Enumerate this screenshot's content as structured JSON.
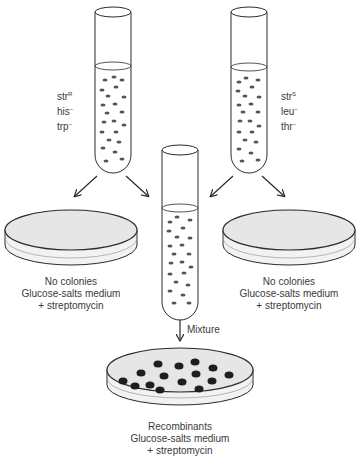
{
  "diagram": {
    "type": "bacterial-conjugation-recombination-experiment",
    "colors": {
      "line": "#2a2a2a",
      "medium": "#e6e6e6",
      "cell": "#555555",
      "colony": "#1e1e1e"
    },
    "tubes": [
      {
        "id": "left-tube",
        "strain": {
          "str": "str",
          "str_sup": "R",
          "m1": "his",
          "m1_sup": "−",
          "m2": "trp",
          "m2_sup": "−"
        }
      },
      {
        "id": "right-tube",
        "strain": {
          "str": "str",
          "str_sup": "S",
          "m1": "leu",
          "m1_sup": "−",
          "m2": "thr",
          "m2_sup": "−"
        }
      },
      {
        "id": "mixture-tube"
      }
    ],
    "plates": {
      "left": {
        "line1": "No colonies",
        "line2": "Glucose-salts medium",
        "line3": "+ streptomycin"
      },
      "right": {
        "line1": "No colonies",
        "line2": "Glucose-salts medium",
        "line3": "+ streptomycin"
      },
      "bottom": {
        "line1": "Recombinants",
        "line2": "Glucose-salts medium",
        "line3": "+ streptomycin",
        "colony_count": 15
      }
    },
    "arrow_labels": {
      "mixture": "Mixture"
    }
  }
}
